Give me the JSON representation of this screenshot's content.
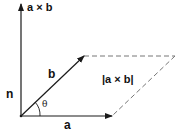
{
  "diagram": {
    "labels": {
      "cross": "a × b",
      "normal": "n",
      "vec_b": "b",
      "vec_a": "a",
      "angle": "θ",
      "magnitude": "|a × b|"
    },
    "colors": {
      "stroke": "#1a1a1a",
      "dashed": "#777777",
      "background": "#ffffff"
    },
    "geometry": {
      "origin": [
        21,
        116
      ],
      "a_tip": [
        112,
        116
      ],
      "b_tip": [
        84,
        56
      ],
      "far_corner": [
        175,
        56
      ],
      "normal_tip": [
        21,
        3
      ]
    }
  }
}
